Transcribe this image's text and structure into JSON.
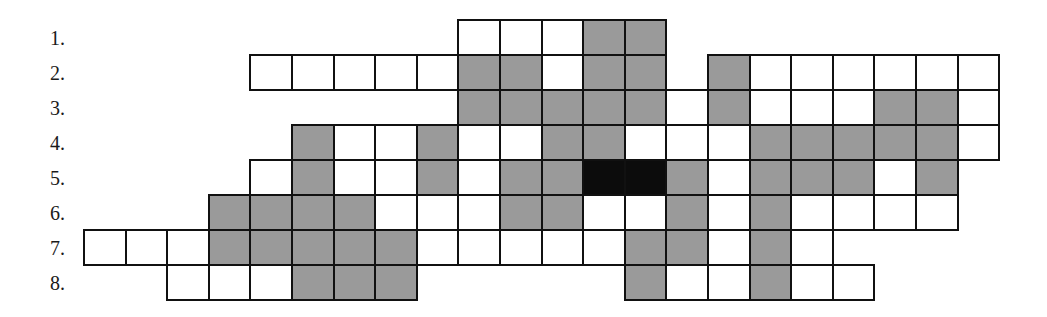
{
  "puzzle": {
    "type": "crossword-grid",
    "grid_origin_x": 84,
    "grid_origin_y": 20,
    "cell_width": 41.6,
    "cell_height": 35,
    "colors": {
      "white": "#ffffff",
      "gray": "#9a9a9a",
      "black": "#0c0c0c",
      "border": "#111111"
    },
    "rows": [
      {
        "label": "1.",
        "cells": {
          "9": "W",
          "10": "W",
          "11": "W",
          "12": "G",
          "13": "G"
        }
      },
      {
        "label": "2.",
        "cells": {
          "4": "W",
          "5": "W",
          "6": "W",
          "7": "W",
          "8": "W",
          "9": "G",
          "10": "G",
          "11": "W",
          "12": "G",
          "13": "G",
          "15": "G",
          "16": "W",
          "17": "W",
          "18": "W",
          "19": "W",
          "20": "W",
          "21": "W"
        }
      },
      {
        "label": "3.",
        "cells": {
          "9": "G",
          "10": "G",
          "11": "G",
          "12": "G",
          "13": "G",
          "14": "W",
          "15": "G",
          "16": "W",
          "17": "W",
          "18": "W",
          "19": "G",
          "20": "G",
          "21": "W"
        }
      },
      {
        "label": "4.",
        "cells": {
          "5": "G",
          "6": "W",
          "7": "W",
          "8": "G",
          "9": "W",
          "10": "W",
          "11": "G",
          "12": "G",
          "13": "W",
          "14": "W",
          "15": "W",
          "16": "G",
          "17": "G",
          "18": "G",
          "19": "G",
          "20": "G",
          "21": "W"
        }
      },
      {
        "label": "5.",
        "cells": {
          "4": "W",
          "5": "G",
          "6": "W",
          "7": "W",
          "8": "G",
          "9": "W",
          "10": "G",
          "11": "G",
          "12": "B",
          "13": "B",
          "14": "G",
          "15": "W",
          "16": "G",
          "17": "G",
          "18": "G",
          "19": "W",
          "20": "G"
        }
      },
      {
        "label": "6.",
        "cells": {
          "3": "G",
          "4": "G",
          "5": "G",
          "6": "G",
          "7": "W",
          "8": "W",
          "9": "W",
          "10": "G",
          "11": "G",
          "12": "W",
          "13": "W",
          "14": "G",
          "15": "W",
          "16": "G",
          "17": "W",
          "18": "W",
          "19": "W",
          "20": "W"
        }
      },
      {
        "label": "7.",
        "cells": {
          "0": "W",
          "1": "W",
          "2": "W",
          "3": "G",
          "4": "G",
          "5": "G",
          "6": "G",
          "7": "G",
          "8": "W",
          "9": "W",
          "10": "W",
          "11": "W",
          "12": "W",
          "13": "G",
          "14": "G",
          "15": "W",
          "16": "G",
          "17": "W"
        }
      },
      {
        "label": "8.",
        "cells": {
          "2": "W",
          "3": "W",
          "4": "W",
          "5": "G",
          "6": "G",
          "7": "G",
          "13": "G",
          "14": "W",
          "15": "W",
          "16": "G",
          "17": "W",
          "18": "W"
        }
      }
    ]
  }
}
